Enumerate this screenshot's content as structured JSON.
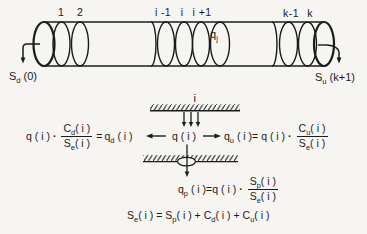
{
  "colors": {
    "ink": "#1b1b1b",
    "paper": "#f6f5f2"
  },
  "figure": {
    "tube": {
      "labels": [
        "1",
        "2",
        "i -1",
        "i",
        "i +1",
        "k-1",
        "k"
      ],
      "q_inner": {
        "base": "q",
        "sub": "j"
      },
      "left_outflow": {
        "base": "S",
        "sub": "d",
        "rest": " (0)"
      },
      "right_outflow": {
        "base": "S",
        "sub": "u",
        "rest": " (k+1)"
      }
    },
    "detail": {
      "section_label": "i",
      "main_row": {
        "left": {
          "q": "q ( i )",
          "dot": "·",
          "num": {
            "base": "C",
            "sub": "d",
            "rest": "( i )"
          },
          "den": {
            "base": "S",
            "sub": "e",
            "rest": "( i )"
          },
          "eq": "=",
          "res": {
            "base": "q",
            "sub": "d",
            "rest": " ( i )"
          }
        },
        "center_q": "q ( i )",
        "right": {
          "res": {
            "base": "q",
            "sub": "u",
            "rest": " ( i )= "
          },
          "q": "q ( i )",
          "dot": "·",
          "num": {
            "base": "C",
            "sub": "u",
            "rest": "( i )"
          },
          "den": {
            "base": "S",
            "sub": "e",
            "rest": "( i )"
          }
        }
      },
      "pore_row": {
        "res": {
          "base": "q",
          "sub": "p",
          "rest": " ( i )="
        },
        "q": "q ( i )",
        "dot": "·",
        "num": {
          "base": "S",
          "sub": "p",
          "rest": "( i )"
        },
        "den": {
          "base": "S",
          "sub": "e",
          "rest": "( i )"
        }
      },
      "total_row": {
        "t1": {
          "base": "S",
          "sub": "e",
          "rest": "( i ) = "
        },
        "t2": {
          "base": "S",
          "sub": "p",
          "rest": "( i ) + "
        },
        "t3": {
          "base": "C",
          "sub": "d",
          "rest": "( i ) + "
        },
        "t4": {
          "base": "C",
          "sub": "u",
          "rest": "( i )"
        }
      }
    }
  }
}
